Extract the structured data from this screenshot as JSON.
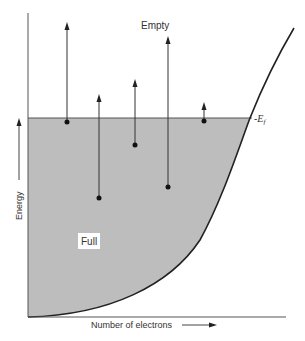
{
  "diagram": {
    "labels": {
      "empty": "Empty",
      "full": "Full",
      "fermi_prefix": "-",
      "fermi_symbol": "E",
      "fermi_subscript": "f",
      "y_axis": "Energy",
      "x_axis": "Number of electrons"
    },
    "colors": {
      "fill": "#bdbdbd",
      "lines": "#333333",
      "background": "#ffffff"
    },
    "electrons": [
      {
        "x": 67,
        "y": 122,
        "arrow_top": 23
      },
      {
        "x": 99,
        "y": 198,
        "arrow_top": 95
      },
      {
        "x": 135,
        "y": 145,
        "arrow_top": 80
      },
      {
        "x": 168,
        "y": 187,
        "arrow_top": 37
      },
      {
        "x": 204,
        "y": 121,
        "arrow_top": 103
      }
    ]
  }
}
